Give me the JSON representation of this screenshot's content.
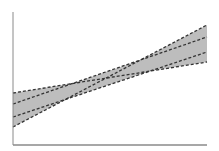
{
  "chart_data": {
    "type": "area",
    "title": "",
    "xlabel": "",
    "ylabel": "",
    "grid": false,
    "legend": null,
    "xlim": [
      0,
      1
    ],
    "ylim": [
      0,
      1
    ],
    "x": [
      0,
      1
    ],
    "series": [
      {
        "name": "upper-left-bound",
        "style": "dashed",
        "values": [
          0.39,
          0.62
        ]
      },
      {
        "name": "inner-line-1",
        "style": "dashed",
        "values": [
          0.31,
          0.81
        ]
      },
      {
        "name": "inner-line-2",
        "style": "dashed",
        "values": [
          0.21,
          0.7
        ]
      },
      {
        "name": "lower-left-bound",
        "style": "dashed",
        "values": [
          0.14,
          0.9
        ]
      }
    ],
    "band": {
      "fill": "#bdbdbd",
      "line_color": "#333333",
      "axis_color": "#888888"
    },
    "pixel_geometry": {
      "plot_left": 13,
      "plot_right": 207,
      "plot_top": 12,
      "plot_bottom": 145,
      "lines_px": [
        {
          "y_left": 93,
          "y_right": 62
        },
        {
          "y_left": 104,
          "y_right": 37
        },
        {
          "y_left": 117,
          "y_right": 52
        },
        {
          "y_left": 127,
          "y_right": 25
        }
      ]
    }
  }
}
